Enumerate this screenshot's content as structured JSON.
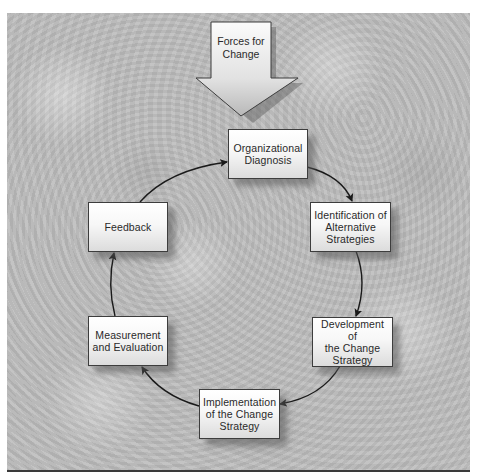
{
  "diagram": {
    "type": "cycle-flowchart",
    "input_arrow": {
      "label_line1": "Forces for",
      "label_line2": "Change",
      "points_to": "Organizational Diagnosis"
    },
    "nodes": [
      {
        "id": "org-diagnosis",
        "line1": "Organizational",
        "line2": "Diagnosis",
        "line3": ""
      },
      {
        "id": "identification",
        "line1": "Identification of",
        "line2": "Alternative",
        "line3": "Strategies"
      },
      {
        "id": "development",
        "line1": "Development of",
        "line2": "the Change",
        "line3": "Strategy"
      },
      {
        "id": "implementation",
        "line1": "Implementation",
        "line2": "of the Change",
        "line3": "Strategy"
      },
      {
        "id": "measurement",
        "line1": "Measurement",
        "line2": "and Evaluation",
        "line3": ""
      },
      {
        "id": "feedback",
        "line1": "Feedback",
        "line2": "",
        "line3": ""
      }
    ],
    "edges": [
      {
        "from": "org-diagnosis",
        "to": "identification"
      },
      {
        "from": "identification",
        "to": "development"
      },
      {
        "from": "development",
        "to": "implementation"
      },
      {
        "from": "implementation",
        "to": "measurement"
      },
      {
        "from": "measurement",
        "to": "feedback"
      },
      {
        "from": "feedback",
        "to": "org-diagnosis"
      }
    ],
    "colors": {
      "background": "#bdbdbd",
      "box_border": "#3d3d3d",
      "text": "#2a2a2a",
      "connector": "#1a1a1a"
    }
  }
}
